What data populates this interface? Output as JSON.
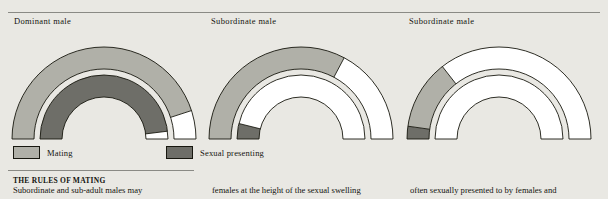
{
  "diagrams": [
    {
      "title": "Dominant male",
      "outer_ring": [
        {
          "label": "Mating",
          "color": "#b0b0a8",
          "start_deg": 180,
          "end_deg": 18
        },
        {
          "label": "None",
          "color": "#ffffff",
          "start_deg": 18,
          "end_deg": 0
        }
      ],
      "inner_ring": [
        {
          "label": "Sexual presenting",
          "color": "#6e6e68",
          "start_deg": 180,
          "end_deg": 7
        },
        {
          "label": "None",
          "color": "#ffffff",
          "start_deg": 7,
          "end_deg": 0
        }
      ]
    },
    {
      "title": "Subordinate male",
      "outer_ring": [
        {
          "label": "Mating",
          "color": "#b0b0a8",
          "start_deg": 180,
          "end_deg": 62
        },
        {
          "label": "None",
          "color": "#ffffff",
          "start_deg": 62,
          "end_deg": 0
        }
      ],
      "inner_ring": [
        {
          "label": "Sexual presenting",
          "color": "#6e6e68",
          "start_deg": 180,
          "end_deg": 166
        },
        {
          "label": "None",
          "color": "#ffffff",
          "start_deg": 166,
          "end_deg": 0
        }
      ]
    },
    {
      "title": "Subordinate male",
      "outer_ring": [
        {
          "label": "Sexual presenting",
          "color": "#6e6e68",
          "start_deg": 180,
          "end_deg": 172
        },
        {
          "label": "Mating",
          "color": "#b0b0a8",
          "start_deg": 172,
          "end_deg": 128
        },
        {
          "label": "None",
          "color": "#ffffff",
          "start_deg": 128,
          "end_deg": 0
        }
      ],
      "inner_ring": [
        {
          "label": "None",
          "color": "#ffffff",
          "start_deg": 180,
          "end_deg": 0
        }
      ]
    }
  ],
  "legend": {
    "items": [
      {
        "label": "Mating",
        "color": "#b0b0a8"
      },
      {
        "label": "Sexual presenting",
        "color": "#6e6e68"
      }
    ]
  },
  "footer": {
    "heading": "THE RULES OF MATING",
    "columns": [
      "Subordinate and sub-adult males may",
      "females at the height of the sexual swelling",
      "often sexually presented to by females and"
    ]
  },
  "colors": {
    "background": "#e9e8e3",
    "stroke": "#17170f",
    "rule": "#8a8a85",
    "mating": "#b0b0a8",
    "presenting": "#6e6e68",
    "empty": "#ffffff"
  }
}
